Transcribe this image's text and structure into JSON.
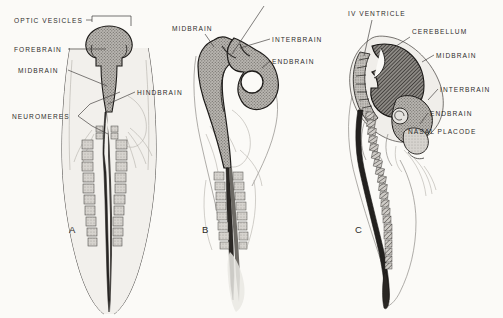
{
  "figure": {
    "background_color": "#fbfaf7",
    "ink_color": "#2e2c2b"
  },
  "panels": [
    {
      "id": "A",
      "letter": "A",
      "view": "dorsal",
      "stage": "early neural tube with optic vesicles",
      "labels": [
        {
          "key": "optic_vesicles",
          "text": "OPTIC VESICLES",
          "pointer": "bracket"
        },
        {
          "key": "forebrain",
          "text": "FOREBRAIN",
          "pointer": "line"
        },
        {
          "key": "midbrain",
          "text": "MIDBRAIN",
          "pointer": "line"
        },
        {
          "key": "hindbrain",
          "text": "HINDBRAIN",
          "pointer": "line"
        },
        {
          "key": "neuromeres",
          "text": "NEUROMERES",
          "pointer": "fork"
        }
      ]
    },
    {
      "id": "B",
      "letter": "B",
      "view": "lateral",
      "stage": "flexed brain with optic cup",
      "labels": [
        {
          "key": "midbrain",
          "text": "MIDBRAIN",
          "pointer": "line"
        },
        {
          "key": "interbrain",
          "text": "INTERBRAIN",
          "pointer": "line"
        },
        {
          "key": "endbrain",
          "text": "ENDBRAIN",
          "pointer": "line"
        }
      ]
    },
    {
      "id": "C",
      "letter": "C",
      "view": "lateral",
      "stage": "differentiated brain with cerebellum",
      "labels": [
        {
          "key": "iv_ventricle",
          "text": "IV VENTRICLE",
          "pointer": "line"
        },
        {
          "key": "cerebellum",
          "text": "CEREBELLUM",
          "pointer": "line"
        },
        {
          "key": "midbrain",
          "text": "MIDBRAIN",
          "pointer": "line"
        },
        {
          "key": "interbrain",
          "text": "INTERBRAIN",
          "pointer": "line"
        },
        {
          "key": "endbrain",
          "text": "ENDBRAIN",
          "pointer": "line"
        },
        {
          "key": "nasal_placode",
          "text": "NASAL PLACODE",
          "pointer": "line"
        }
      ]
    }
  ]
}
